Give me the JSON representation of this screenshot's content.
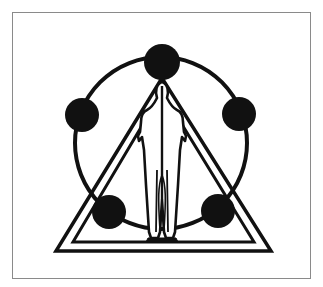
{
  "figure": {
    "colors": {
      "ink": "#111111",
      "frame": "#8a8a8a",
      "background": "#ffffff"
    },
    "circle": {
      "cx": 161,
      "cy": 143,
      "r": 86
    },
    "nodes": [
      {
        "name": "top",
        "cx": 162,
        "cy": 62,
        "r": 18
      },
      {
        "name": "upper-left",
        "cx": 82,
        "cy": 115,
        "r": 17
      },
      {
        "name": "upper-right",
        "cx": 239,
        "cy": 114,
        "r": 17
      },
      {
        "name": "lower-left",
        "cx": 109,
        "cy": 212,
        "r": 17
      },
      {
        "name": "lower-right",
        "cx": 218,
        "cy": 211,
        "r": 17
      }
    ],
    "triangles": [
      {
        "name": "outer-triangle",
        "points": "162,82 56,251 271,251"
      },
      {
        "name": "inner-triangle",
        "points": "162,94 74,243 254,243"
      }
    ]
  }
}
